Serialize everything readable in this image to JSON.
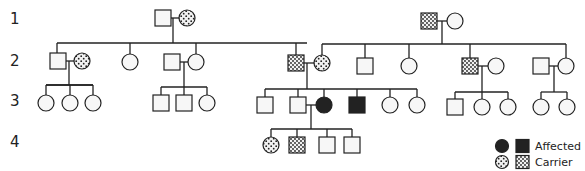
{
  "colors": {
    "line": "#222222",
    "affected": "#222222",
    "unaffected": "#ffffff"
  },
  "generation_labels": [
    {
      "label": "1",
      "y": 24
    },
    {
      "label": "2",
      "y": 66
    },
    {
      "label": "3",
      "y": 106
    },
    {
      "label": "4",
      "y": 147
    }
  ],
  "legend": {
    "affected_label": "Affected",
    "carrier_label": "Carrier"
  },
  "individuals": [
    {
      "id": "I-1",
      "gen": 1,
      "sex": "male",
      "status": "unaffected",
      "x": 163,
      "y": 18
    },
    {
      "id": "I-2",
      "gen": 1,
      "sex": "female",
      "status": "carrier",
      "x": 187,
      "y": 18
    },
    {
      "id": "I-3",
      "gen": 1,
      "sex": "male",
      "status": "carrier",
      "x": 429,
      "y": 21
    },
    {
      "id": "I-4",
      "gen": 1,
      "sex": "female",
      "status": "unaffected",
      "x": 455,
      "y": 21
    },
    {
      "id": "II-1",
      "gen": 2,
      "sex": "male",
      "status": "unaffected",
      "x": 58,
      "y": 61
    },
    {
      "id": "II-2",
      "gen": 2,
      "sex": "female",
      "status": "carrier",
      "x": 82,
      "y": 61
    },
    {
      "id": "II-3",
      "gen": 2,
      "sex": "female",
      "status": "unaffected",
      "x": 130,
      "y": 62
    },
    {
      "id": "II-4",
      "gen": 2,
      "sex": "male",
      "status": "unaffected",
      "x": 172,
      "y": 62
    },
    {
      "id": "II-5",
      "gen": 2,
      "sex": "female",
      "status": "unaffected",
      "x": 196,
      "y": 62
    },
    {
      "id": "II-6",
      "gen": 2,
      "sex": "male",
      "status": "carrier",
      "x": 296,
      "y": 63
    },
    {
      "id": "II-7",
      "gen": 2,
      "sex": "female",
      "status": "carrier",
      "x": 322,
      "y": 63
    },
    {
      "id": "II-8",
      "gen": 2,
      "sex": "male",
      "status": "unaffected",
      "x": 365,
      "y": 66
    },
    {
      "id": "II-9",
      "gen": 2,
      "sex": "female",
      "status": "unaffected",
      "x": 409,
      "y": 66
    },
    {
      "id": "II-10",
      "gen": 2,
      "sex": "male",
      "status": "carrier",
      "x": 470,
      "y": 66
    },
    {
      "id": "II-11",
      "gen": 2,
      "sex": "female",
      "status": "unaffected",
      "x": 496,
      "y": 66
    },
    {
      "id": "II-12",
      "gen": 2,
      "sex": "male",
      "status": "unaffected",
      "x": 541,
      "y": 66
    },
    {
      "id": "II-13",
      "gen": 2,
      "sex": "female",
      "status": "unaffected",
      "x": 566,
      "y": 66
    },
    {
      "id": "III-1",
      "gen": 3,
      "sex": "female",
      "status": "unaffected",
      "x": 46,
      "y": 103
    },
    {
      "id": "III-2",
      "gen": 3,
      "sex": "female",
      "status": "unaffected",
      "x": 70,
      "y": 103
    },
    {
      "id": "III-3",
      "gen": 3,
      "sex": "female",
      "status": "unaffected",
      "x": 93,
      "y": 103
    },
    {
      "id": "III-4",
      "gen": 3,
      "sex": "male",
      "status": "unaffected",
      "x": 161,
      "y": 103
    },
    {
      "id": "III-5",
      "gen": 3,
      "sex": "male",
      "status": "unaffected",
      "x": 184,
      "y": 103
    },
    {
      "id": "III-6",
      "gen": 3,
      "sex": "female",
      "status": "unaffected",
      "x": 207,
      "y": 103
    },
    {
      "id": "III-7",
      "gen": 3,
      "sex": "male",
      "status": "unaffected",
      "x": 265,
      "y": 105
    },
    {
      "id": "III-8",
      "gen": 3,
      "sex": "male",
      "status": "unaffected",
      "x": 298,
      "y": 105
    },
    {
      "id": "III-9",
      "gen": 3,
      "sex": "female",
      "status": "affected",
      "x": 324,
      "y": 105
    },
    {
      "id": "III-10",
      "gen": 3,
      "sex": "male",
      "status": "affected",
      "x": 357,
      "y": 105
    },
    {
      "id": "III-11",
      "gen": 3,
      "sex": "female",
      "status": "unaffected",
      "x": 390,
      "y": 105
    },
    {
      "id": "III-12",
      "gen": 3,
      "sex": "female",
      "status": "unaffected",
      "x": 417,
      "y": 105
    },
    {
      "id": "III-13",
      "gen": 3,
      "sex": "male",
      "status": "unaffected",
      "x": 455,
      "y": 107
    },
    {
      "id": "III-14",
      "gen": 3,
      "sex": "female",
      "status": "unaffected",
      "x": 482,
      "y": 107
    },
    {
      "id": "III-15",
      "gen": 3,
      "sex": "female",
      "status": "unaffected",
      "x": 508,
      "y": 107
    },
    {
      "id": "III-16",
      "gen": 3,
      "sex": "female",
      "status": "unaffected",
      "x": 541,
      "y": 107
    },
    {
      "id": "III-17",
      "gen": 3,
      "sex": "female",
      "status": "unaffected",
      "x": 567,
      "y": 107
    },
    {
      "id": "IV-1",
      "gen": 4,
      "sex": "female",
      "status": "carrier",
      "x": 271,
      "y": 145
    },
    {
      "id": "IV-2",
      "gen": 4,
      "sex": "male",
      "status": "carrier",
      "x": 297,
      "y": 145
    },
    {
      "id": "IV-3",
      "gen": 4,
      "sex": "male",
      "status": "unaffected",
      "x": 327,
      "y": 145
    },
    {
      "id": "IV-4",
      "gen": 4,
      "sex": "male",
      "status": "unaffected",
      "x": 352,
      "y": 145
    }
  ],
  "lines": [
    [
      171,
      18,
      179,
      18
    ],
    [
      173,
      18,
      173,
      43
    ],
    [
      57,
      43,
      307,
      43
    ],
    [
      57,
      43,
      57,
      53
    ],
    [
      130,
      43,
      130,
      54
    ],
    [
      196,
      43,
      196,
      54
    ],
    [
      296,
      43,
      296,
      55
    ],
    [
      66,
      61,
      74,
      61
    ],
    [
      69,
      61,
      69,
      85
    ],
    [
      46,
      85,
      93,
      85
    ],
    [
      46,
      85,
      93,
      85
    ],
    [
      46,
      85,
      46,
      95
    ],
    [
      70,
      85,
      70,
      95
    ],
    [
      93,
      85,
      93,
      95
    ],
    [
      180,
      62,
      188,
      62
    ],
    [
      184,
      62,
      184,
      87
    ],
    [
      161,
      87,
      207,
      87
    ],
    [
      161,
      87,
      161,
      95
    ],
    [
      184,
      87,
      184,
      95
    ],
    [
      207,
      87,
      207,
      95
    ],
    [
      437,
      21,
      447,
      21
    ],
    [
      442,
      21,
      442,
      44
    ],
    [
      322,
      44,
      566,
      44
    ],
    [
      322,
      44,
      322,
      55
    ],
    [
      365,
      44,
      365,
      58
    ],
    [
      409,
      44,
      409,
      58
    ],
    [
      470,
      44,
      470,
      58
    ],
    [
      566,
      44,
      566,
      58
    ],
    [
      304,
      63,
      314,
      63
    ],
    [
      307,
      63,
      307,
      89
    ],
    [
      265,
      89,
      417,
      89
    ],
    [
      265,
      89,
      265,
      97
    ],
    [
      298,
      89,
      298,
      97
    ],
    [
      324,
      89,
      324,
      97
    ],
    [
      357,
      89,
      357,
      97
    ],
    [
      390,
      89,
      390,
      97
    ],
    [
      417,
      89,
      417,
      97
    ],
    [
      306,
      105,
      316,
      105
    ],
    [
      311,
      105,
      311,
      129
    ],
    [
      271,
      129,
      352,
      129
    ],
    [
      271,
      129,
      271,
      137
    ],
    [
      297,
      129,
      297,
      137
    ],
    [
      327,
      129,
      327,
      137
    ],
    [
      352,
      129,
      352,
      137
    ],
    [
      478,
      66,
      488,
      66
    ],
    [
      482,
      66,
      482,
      92
    ],
    [
      455,
      92,
      508,
      92
    ],
    [
      455,
      92,
      455,
      99
    ],
    [
      482,
      92,
      482,
      99
    ],
    [
      508,
      92,
      508,
      99
    ],
    [
      549,
      66,
      558,
      66
    ],
    [
      554,
      66,
      554,
      92
    ],
    [
      541,
      92,
      567,
      92
    ],
    [
      541,
      92,
      541,
      99
    ],
    [
      567,
      92,
      567,
      99
    ]
  ]
}
